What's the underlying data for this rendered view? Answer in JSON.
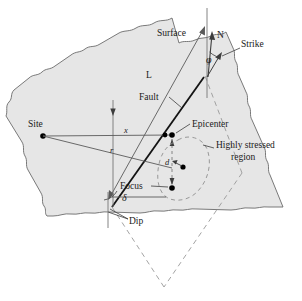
{
  "figure": {
    "kind": "seismology-fault-geometry-diagram",
    "title": "",
    "colors": {
      "surface_fill": "#e6e6e6",
      "surface_stroke": "#6b6b6b",
      "line": "#4d4d4d",
      "fault_trace": "#1a1a1a",
      "dashed": "#8c8c8c",
      "text": "#1a1a1a",
      "marker": "#000000",
      "background": "#ffffff"
    },
    "labels": {
      "surface": "Surface",
      "north": "N",
      "strike": "Strike",
      "fault_length": "L",
      "fault": "Fault",
      "site": "Site",
      "epicenter": "Epicenter",
      "highly_stressed_line1": "Highly stressed",
      "highly_stressed_line2": "region",
      "focus": "Focus",
      "dip": "Dip",
      "distance_x": "x",
      "distance_r": "r",
      "depth_d": "d",
      "angle_phi": "φ",
      "angle_delta": "δ"
    }
  }
}
